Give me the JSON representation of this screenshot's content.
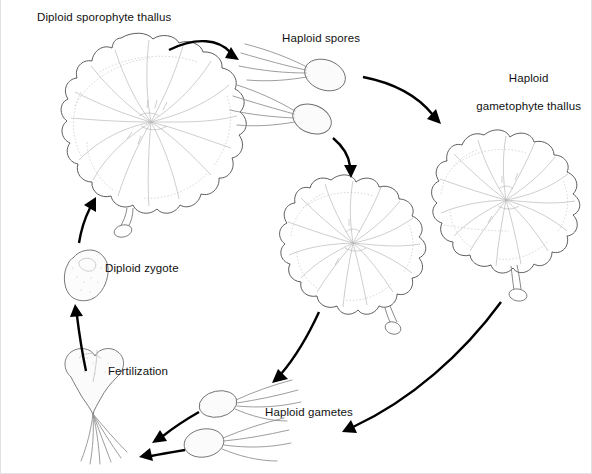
{
  "figure": {
    "background_color": "#ffffff",
    "border_color": "#e2e2e2",
    "ink_color": "#000000",
    "outline_color": "#4a4a4a",
    "text_color": "#111111"
  },
  "labels": {
    "diploid_sporophyte_thallus": "Diploid sporophyte thallus",
    "haploid_spores": "Haploid spores",
    "haploid_gametophyte_thallus_line1": "Haploid",
    "haploid_gametophyte_thallus_line2": "gametophyte thallus",
    "diploid_zygote": "Diploid zygote",
    "fertilization": "Fertilization",
    "haploid_gametes": "Haploid gametes"
  },
  "stages": [
    {
      "id": "diploid-sporophyte-thallus",
      "label": "Diploid sporophyte thallus",
      "ploidy": "diploid",
      "kind": "thallus",
      "position": "top-left"
    },
    {
      "id": "haploid-spores",
      "label": "Haploid spores",
      "ploidy": "haploid",
      "kind": "flagellated-spore",
      "count": 2,
      "position": "top-center"
    },
    {
      "id": "haploid-gametophyte-thallus",
      "label": "Haploid gametophyte thallus",
      "ploidy": "haploid",
      "kind": "thallus",
      "count": 2,
      "position": "right"
    },
    {
      "id": "haploid-gametes",
      "label": "Haploid gametes",
      "ploidy": "haploid",
      "kind": "flagellated-gamete",
      "count": 2,
      "position": "bottom-center"
    },
    {
      "id": "fertilization",
      "label": "Fertilization",
      "kind": "gamete-fusion",
      "position": "bottom-left"
    },
    {
      "id": "diploid-zygote",
      "label": "Diploid zygote",
      "ploidy": "diploid",
      "kind": "zygote",
      "position": "left"
    }
  ],
  "arrows": [
    {
      "id": "sporophyte-to-spores",
      "from": "diploid-sporophyte-thallus",
      "to": "haploid-spores",
      "process": "meiosis"
    },
    {
      "id": "spores-to-gametophyte",
      "from": "haploid-spores",
      "to": "haploid-gametophyte-thallus",
      "process": "germination"
    },
    {
      "id": "spores-to-center-gametophyte",
      "from": "haploid-spores",
      "to": "haploid-gametophyte-thallus",
      "process": "germination"
    },
    {
      "id": "gametophyte-center-to-gametes",
      "from": "haploid-gametophyte-thallus",
      "to": "haploid-gametes",
      "process": "gamete release"
    },
    {
      "id": "gametophyte-right-to-gametes",
      "from": "haploid-gametophyte-thallus",
      "to": "haploid-gametes",
      "process": "gamete release"
    },
    {
      "id": "gametes-to-fertilization-upper",
      "from": "haploid-gametes",
      "to": "fertilization",
      "process": "syngamy"
    },
    {
      "id": "gametes-to-fertilization-lower",
      "from": "haploid-gametes",
      "to": "fertilization",
      "process": "syngamy"
    },
    {
      "id": "fertilization-to-zygote",
      "from": "fertilization",
      "to": "diploid-zygote",
      "process": "zygote formation"
    },
    {
      "id": "zygote-to-sporophyte",
      "from": "diploid-zygote",
      "to": "diploid-sporophyte-thallus",
      "process": "development"
    }
  ]
}
